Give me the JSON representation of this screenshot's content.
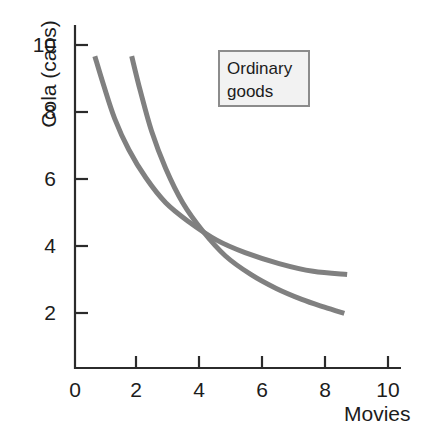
{
  "chart_data": {
    "type": "line",
    "title": "",
    "subtitle": "",
    "xlabel": "Movies",
    "ylabel": "Cola (cans)",
    "xlim": [
      0,
      11.5
    ],
    "ylim": [
      0,
      11
    ],
    "grid": false,
    "legend_position": "upper-right-inside",
    "annotations": [
      {
        "name": "ordinary-goods-label",
        "line1": "Ordinary",
        "line2": "goods",
        "text": "Ordinary goods"
      }
    ],
    "xticks": [
      0,
      2,
      4,
      6,
      8,
      10
    ],
    "xtick_labels": [
      "0",
      "2",
      "4",
      "6",
      "8",
      "10"
    ],
    "yticks": [
      2,
      4,
      6,
      8,
      10
    ],
    "ytick_labels": [
      "2",
      "4",
      "6",
      "8",
      "10"
    ],
    "series": [
      {
        "name": "indifference-curve-outer",
        "color": "#808080",
        "linewidth": 5,
        "x": [
          0.7,
          1.0,
          1.4,
          1.9,
          2.5,
          3.2,
          4.0,
          5.0,
          6.0,
          7.2,
          8.4,
          9.6
        ],
        "y": [
          10.0,
          9.1,
          8.0,
          7.0,
          6.1,
          5.3,
          4.7,
          4.1,
          3.7,
          3.35,
          3.1,
          3.0
        ]
      },
      {
        "name": "indifference-curve-inner",
        "color": "#808080",
        "linewidth": 5,
        "x": [
          2.0,
          2.3,
          2.7,
          3.2,
          3.8,
          4.5,
          5.3,
          6.2,
          7.1,
          8.0,
          8.8,
          9.5
        ],
        "y": [
          10.0,
          8.9,
          7.6,
          6.4,
          5.3,
          4.4,
          3.6,
          3.0,
          2.55,
          2.2,
          1.95,
          1.75
        ]
      }
    ]
  },
  "axes": {
    "axis_color": "#2b2b2b",
    "tick_color": "#2b2b2b"
  },
  "legend": {
    "fill": "#f2f2f2",
    "border": "#8c8c8c"
  },
  "palette": {
    "curve": "#808080",
    "text": "#1c1c1c",
    "background": "#ffffff"
  }
}
